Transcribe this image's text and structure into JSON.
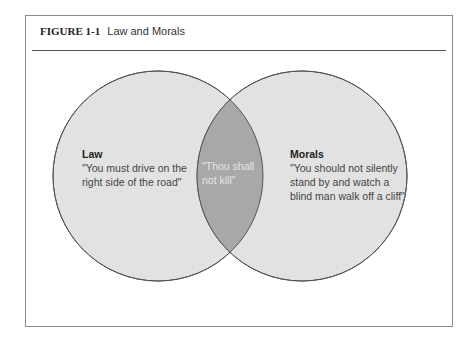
{
  "figure": {
    "label": "FIGURE 1-1",
    "title": "Law and Morals"
  },
  "venn": {
    "colors": {
      "circle_fill": "#e2e2e2",
      "overlap_fill": "#a8a8a8",
      "stroke": "#555555"
    },
    "sets": [
      {
        "name": "Law",
        "quote": "\"You must drive on the right side of the road\""
      },
      {
        "name": "Morals",
        "quote": "\"You should not silently stand by and watch a blind man walk off a cliff\""
      }
    ],
    "intersection": {
      "quote": "\"Thou shall not kill\""
    }
  }
}
